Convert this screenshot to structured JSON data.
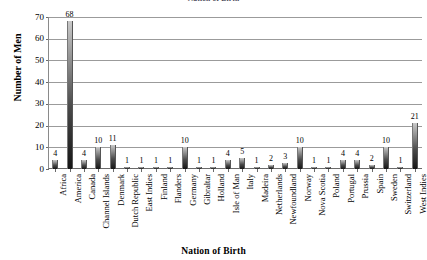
{
  "chart_data": {
    "type": "bar",
    "title": "Nation of Birth",
    "xlabel": "Nation of Birth",
    "ylabel": "Number of Men",
    "ylim": [
      0,
      70
    ],
    "yticks": [
      0,
      10,
      20,
      30,
      40,
      50,
      60,
      70
    ],
    "grid": true,
    "legend": "none",
    "show_value_labels": true,
    "categories": [
      "Africa",
      "America",
      "Canada",
      "Channel Islands",
      "Denmark",
      "Dutch Republic",
      "East Indies",
      "Finland",
      "Flanders",
      "Germany",
      "Gibraltar",
      "Holland",
      "Isle of Man",
      "Italy",
      "Madeira",
      "Netherlands",
      "Newfoundland",
      "Norway",
      "Nova Scotia",
      "Poland",
      "Portugal",
      "Prussia",
      "Spain",
      "Sweden",
      "Switzerland",
      "West Indies"
    ],
    "values": [
      4,
      68,
      4,
      10,
      11,
      1,
      1,
      1,
      1,
      10,
      1,
      1,
      4,
      5,
      1,
      2,
      3,
      10,
      1,
      1,
      4,
      4,
      2,
      10,
      1,
      21
    ],
    "value_labels": [
      "4",
      "68",
      "4",
      "10",
      "11",
      "1",
      "1",
      "1",
      "1",
      "10",
      "1",
      "1",
      "4",
      "5",
      "1",
      "2",
      "3",
      "10",
      "1",
      "1",
      "4",
      "4",
      "2",
      "10",
      "1",
      "21"
    ],
    "ytick_labels": [
      "0",
      "10",
      "20",
      "30",
      "40",
      "50",
      "60",
      "70"
    ],
    "colors": {
      "bar_top": "#c9c9c9",
      "bar_bottom": "#151515",
      "gridline": "#9b9b9b",
      "axis": "#6a6a6a",
      "text": "#000000",
      "background": "#ffffff"
    }
  }
}
